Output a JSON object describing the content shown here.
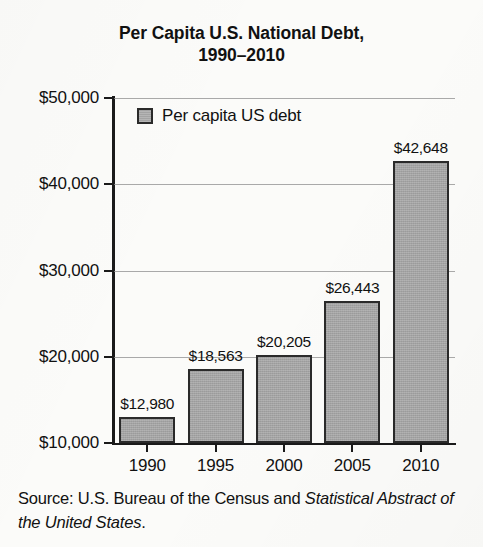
{
  "chart_data": {
    "type": "bar",
    "title": "Per Capita U.S. National Debt, 1990–2010",
    "title_line1": "Per Capita U.S. National Debt,",
    "title_line2": "1990–2010",
    "xlabel": "",
    "ylabel": "",
    "categories": [
      "1990",
      "1995",
      "2000",
      "2005",
      "2010"
    ],
    "values": [
      12980,
      18563,
      20205,
      26443,
      42648
    ],
    "value_labels": [
      "$12,980",
      "$18,563",
      "$20,205",
      "$26,443",
      "$42,648"
    ],
    "ylim": [
      10000,
      50000
    ],
    "yticks": [
      10000,
      20000,
      30000,
      40000,
      50000
    ],
    "ytick_labels": [
      "$10,000",
      "$20,000",
      "$30,000",
      "$40,000",
      "$50,000"
    ],
    "grid": true,
    "legend_position": "top-left",
    "series": [
      {
        "name": "Per capita US debt",
        "values": [
          12980,
          18563,
          20205,
          26443,
          42648
        ]
      }
    ],
    "colors": {
      "bar_fill": "#a3a3a3",
      "bar_stroke": "#2a2a2a",
      "axis": "#1a1a1a",
      "gridline": "#8d8d8d",
      "text": "#111111",
      "background": "#fbfbf9"
    }
  },
  "legend": {
    "label": "Per capita US debt"
  },
  "source": {
    "prefix": "Source: U.S. Bureau of the Census and ",
    "italic": "Statistical Abstract of the United States",
    "suffix": "."
  }
}
